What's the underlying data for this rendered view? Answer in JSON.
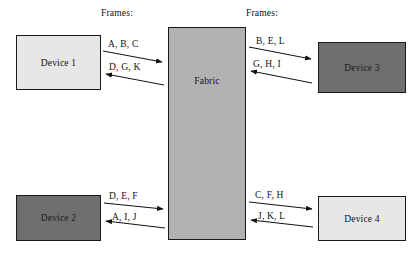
{
  "diagram": {
    "labels": {
      "frames_left": "Frames:",
      "frames_right": "Frames:"
    },
    "nodes": [
      {
        "id": "device1",
        "label": "Device 1",
        "shade": "light"
      },
      {
        "id": "device2",
        "label": "Device 2",
        "shade": "dark"
      },
      {
        "id": "fabric",
        "label": "Fabric",
        "shade": "mid"
      },
      {
        "id": "device3",
        "label": "Device 3",
        "shade": "dark"
      },
      {
        "id": "device4",
        "label": "Device 4",
        "shade": "light"
      }
    ],
    "flows": [
      {
        "id": "d1-to-fabric",
        "from": "Device 1",
        "to": "Fabric",
        "direction": "right",
        "frames": "A, B, C"
      },
      {
        "id": "fabric-to-d1",
        "from": "Fabric",
        "to": "Device 1",
        "direction": "left",
        "frames": "D, G, K"
      },
      {
        "id": "fabric-to-d3",
        "from": "Fabric",
        "to": "Device 3",
        "direction": "right",
        "frames": "B, E, L"
      },
      {
        "id": "d3-to-fabric",
        "from": "Device 3",
        "to": "Fabric",
        "direction": "left",
        "frames": "G, H, I"
      },
      {
        "id": "d2-to-fabric",
        "from": "Device 2",
        "to": "Fabric",
        "direction": "right",
        "frames": "D, E, F"
      },
      {
        "id": "fabric-to-d2",
        "from": "Fabric",
        "to": "Device 2",
        "direction": "left",
        "frames": "A, I, J"
      },
      {
        "id": "fabric-to-d4",
        "from": "Fabric",
        "to": "Device 4",
        "direction": "right",
        "frames": "C, F, H"
      },
      {
        "id": "d4-to-fabric",
        "from": "Device 4",
        "to": "Fabric",
        "direction": "left",
        "frames": "J, K, L"
      }
    ],
    "colors": {
      "background": "#ffffff",
      "node_light": "#e7e7e7",
      "node_mid": "#b2b2b2",
      "node_dark": "#6f6f6f",
      "stroke": "#1a1a1a",
      "text": "#111111"
    }
  }
}
